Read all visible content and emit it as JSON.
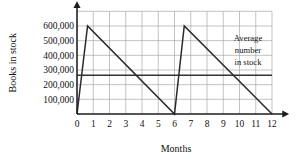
{
  "chart_data": {
    "type": "line",
    "title": "",
    "xlabel": "Months",
    "ylabel": "Books in stock",
    "xlim": [
      0,
      12
    ],
    "ylim": [
      0,
      700000
    ],
    "grid": true,
    "legend_position": "none",
    "x_ticks": [
      "0",
      "1",
      "2",
      "3",
      "4",
      "5",
      "6",
      "7",
      "8",
      "9",
      "10",
      "11",
      "12"
    ],
    "x_tick_values": [
      0,
      1,
      2,
      3,
      4,
      5,
      6,
      7,
      8,
      9,
      10,
      11,
      12
    ],
    "y_ticks": [
      "100,000",
      "200,000",
      "300,000",
      "400,000",
      "500,000",
      "600,000"
    ],
    "y_tick_values": [
      100000,
      200000,
      300000,
      400000,
      500000,
      600000
    ],
    "series": [
      {
        "name": "Books in stock",
        "type": "line",
        "points": [
          {
            "x": 0,
            "y": 0
          },
          {
            "x": 0.65,
            "y": 600000
          },
          {
            "x": 6,
            "y": 0
          },
          {
            "x": 6.6,
            "y": 600000
          },
          {
            "x": 12,
            "y": 0
          }
        ]
      },
      {
        "name": "Average number in stock",
        "type": "horizontal-line",
        "value": 265000,
        "x_start": 0,
        "x_end": 12
      }
    ],
    "annotations": [
      {
        "name": "average-number-in-stock",
        "lines": [
          "Average",
          "number",
          "in stock"
        ],
        "x": 10.55,
        "y": 455000
      }
    ]
  },
  "axes": {
    "y_title": "Books in stock",
    "x_title": "Months"
  },
  "annotation_text": {
    "line1": "Average",
    "line2": "number",
    "line3": "in stock"
  }
}
